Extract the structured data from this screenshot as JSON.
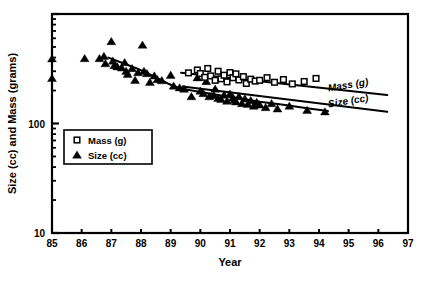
{
  "chart_data": {
    "type": "scatter",
    "title": "",
    "xlabel": "Year",
    "ylabel": "Size (cc) and Mass (grams)",
    "yscale": "log",
    "xlim": [
      85,
      97
    ],
    "ylim": [
      10,
      1000
    ],
    "grid": false,
    "xticks": [
      "85",
      "86",
      "87",
      "88",
      "89",
      "90",
      "91",
      "92",
      "93",
      "94",
      "95",
      "96",
      "97"
    ],
    "yticks": [
      "10",
      "100"
    ],
    "legend": {
      "position": "lower-left-inside",
      "entries": [
        {
          "label": "Mass (g)",
          "marker": "open-square"
        },
        {
          "label": "Size (cc)",
          "marker": "filled-triangle"
        }
      ]
    },
    "annotations": [
      {
        "text": "Mass (g)",
        "x": 95.0,
        "y": 210,
        "style": "italic"
      },
      {
        "text": "Size (cc)",
        "x": 95.0,
        "y": 150,
        "style": "italic"
      }
    ],
    "series": [
      {
        "name": "Size (cc)",
        "marker": "filled-triangle",
        "points": [
          [
            85.0,
            390
          ],
          [
            85.0,
            258
          ],
          [
            86.1,
            392
          ],
          [
            86.6,
            392
          ],
          [
            86.75,
            410
          ],
          [
            86.8,
            352
          ],
          [
            87.0,
            560
          ],
          [
            87.05,
            372
          ],
          [
            87.1,
            338
          ],
          [
            87.2,
            330
          ],
          [
            87.35,
            322
          ],
          [
            87.45,
            360
          ],
          [
            87.5,
            300
          ],
          [
            87.55,
            282
          ],
          [
            87.7,
            318
          ],
          [
            87.8,
            248
          ],
          [
            87.9,
            292
          ],
          [
            88.05,
            520
          ],
          [
            88.1,
            300
          ],
          [
            88.2,
            286
          ],
          [
            88.3,
            238
          ],
          [
            88.45,
            272
          ],
          [
            88.55,
            252
          ],
          [
            88.7,
            246
          ],
          [
            89.0,
            276
          ],
          [
            89.1,
            220
          ],
          [
            89.3,
            212
          ],
          [
            89.45,
            206
          ],
          [
            89.7,
            176
          ],
          [
            89.9,
            262
          ],
          [
            90.0,
            198
          ],
          [
            90.1,
            188
          ],
          [
            90.2,
            242
          ],
          [
            90.3,
            176
          ],
          [
            90.45,
            180
          ],
          [
            90.5,
            206
          ],
          [
            90.6,
            170
          ],
          [
            90.7,
            166
          ],
          [
            90.8,
            182
          ],
          [
            90.9,
            160
          ],
          [
            91.0,
            186
          ],
          [
            91.1,
            172
          ],
          [
            91.15,
            164
          ],
          [
            91.2,
            158
          ],
          [
            91.3,
            176
          ],
          [
            91.4,
            152
          ],
          [
            91.5,
            168
          ],
          [
            91.6,
            150
          ],
          [
            91.7,
            162
          ],
          [
            91.8,
            144
          ],
          [
            91.9,
            156
          ],
          [
            92.0,
            148
          ],
          [
            92.2,
            140
          ],
          [
            92.4,
            152
          ],
          [
            92.6,
            136
          ],
          [
            93.0,
            144
          ],
          [
            93.6,
            132
          ],
          [
            94.2,
            128
          ]
        ]
      },
      {
        "name": "Mass (g)",
        "marker": "open-square",
        "points": [
          [
            89.6,
            290
          ],
          [
            89.9,
            308
          ],
          [
            90.0,
            286
          ],
          [
            90.15,
            264
          ],
          [
            90.25,
            318
          ],
          [
            90.35,
            272
          ],
          [
            90.5,
            248
          ],
          [
            90.6,
            300
          ],
          [
            90.7,
            256
          ],
          [
            90.8,
            276
          ],
          [
            90.9,
            240
          ],
          [
            91.0,
            292
          ],
          [
            91.1,
            262
          ],
          [
            91.2,
            284
          ],
          [
            91.3,
            250
          ],
          [
            91.45,
            268
          ],
          [
            91.55,
            232
          ],
          [
            91.7,
            254
          ],
          [
            91.85,
            244
          ],
          [
            92.0,
            248
          ],
          [
            92.25,
            262
          ],
          [
            92.5,
            238
          ],
          [
            92.8,
            252
          ],
          [
            93.1,
            230
          ],
          [
            93.5,
            242
          ],
          [
            93.9,
            258
          ]
        ]
      }
    ],
    "trend_lines": [
      {
        "name": "Mass (g)",
        "type": "linear-fit",
        "from": [
          89.35,
          290
        ],
        "to": [
          96.3,
          182
        ]
      },
      {
        "name": "Size (cc)",
        "type": "linear-fit",
        "from": [
          89.4,
          218
        ],
        "to": [
          96.3,
          128
        ]
      },
      {
        "name": "Size (cc) early curve",
        "type": "smoothed-curve",
        "points": [
          [
            86.9,
            400
          ],
          [
            87.4,
            355
          ],
          [
            87.9,
            315
          ],
          [
            88.4,
            272
          ],
          [
            88.9,
            232
          ],
          [
            89.3,
            210
          ],
          [
            89.9,
            196
          ],
          [
            90.6,
            182
          ],
          [
            91.3,
            170
          ],
          [
            92.0,
            158
          ],
          [
            92.8,
            148
          ],
          [
            93.6,
            138
          ],
          [
            94.3,
            130
          ]
        ]
      }
    ]
  }
}
